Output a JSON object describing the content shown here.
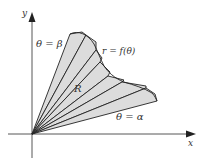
{
  "diagram": {
    "labels": {
      "y_axis": "y",
      "x_axis": "x",
      "theta_beta": "θ = β",
      "theta_alpha": "θ = α",
      "curve": "r = f(θ)",
      "region": "R"
    },
    "colors": {
      "fill": "#dcdcdc",
      "stroke": "#222222",
      "axis": "#333333",
      "text": "#333333"
    },
    "origin": [
      32,
      134
    ],
    "sector_count": 7
  }
}
